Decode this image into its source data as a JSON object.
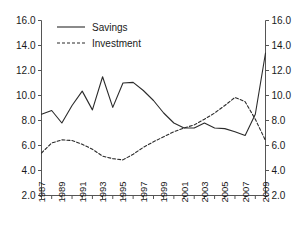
{
  "chart_data": {
    "type": "line",
    "title": "",
    "xlabel": "",
    "ylabel": "",
    "x": [
      1987,
      1988,
      1989,
      1990,
      1991,
      1992,
      1993,
      1994,
      1995,
      1996,
      1997,
      1998,
      1999,
      2000,
      2001,
      2002,
      2003,
      2004,
      2005,
      2006,
      2007,
      2008,
      2009
    ],
    "series": [
      {
        "name": "Savings",
        "style": "solid",
        "values": [
          8.5,
          8.8,
          7.8,
          9.2,
          10.35,
          8.85,
          11.5,
          9.05,
          11.0,
          11.05,
          10.4,
          9.6,
          8.6,
          7.8,
          7.4,
          7.4,
          7.8,
          7.4,
          7.35,
          7.1,
          6.8,
          8.5,
          13.4
        ]
      },
      {
        "name": "Investment",
        "style": "dashed",
        "values": [
          5.4,
          6.2,
          6.45,
          6.4,
          6.1,
          5.7,
          5.15,
          4.95,
          4.85,
          5.3,
          5.85,
          6.3,
          6.7,
          7.1,
          7.4,
          7.65,
          8.1,
          8.6,
          9.2,
          9.85,
          9.5,
          8.1,
          6.4
        ]
      }
    ],
    "xlim": [
      1987,
      2009
    ],
    "ylim": [
      2.0,
      16.0
    ],
    "y_ticks": [
      2.0,
      4.0,
      6.0,
      8.0,
      10.0,
      12.0,
      14.0,
      16.0
    ],
    "y_tick_labels": [
      "2.0",
      "4.0",
      "6.0",
      "8.0",
      "10.0",
      "12.0",
      "14.0",
      "16.0"
    ],
    "y_axis_left_labels": [
      "16.0",
      "14.0",
      "12.0",
      "10.0",
      "8.0",
      "6.0",
      "4.0",
      "2.0"
    ],
    "y_axis_right_labels": [
      "16.0",
      "14.0",
      "12.0",
      "10.0",
      "8.0",
      "6.0",
      "4.0",
      "2.0"
    ],
    "x_ticks": [
      1987,
      1988,
      1989,
      1990,
      1991,
      1992,
      1993,
      1994,
      1995,
      1996,
      1997,
      1998,
      1999,
      2000,
      2001,
      2002,
      2003,
      2004,
      2005,
      2006,
      2007,
      2008,
      2009
    ],
    "x_tick_labels": [
      "1987",
      "1989",
      "1991",
      "1993",
      "1995",
      "1997",
      "1999",
      "2001",
      "2003",
      "2005",
      "2007",
      "2009"
    ],
    "x_labeled_years": [
      1987,
      1989,
      1991,
      1993,
      1995,
      1997,
      1999,
      2001,
      2003,
      2005,
      2007,
      2009
    ],
    "grid": false,
    "legend_position": "top-left",
    "legend": [
      "Savings",
      "Investment"
    ],
    "dual_y_axis": true
  },
  "legend": {
    "items": [
      {
        "label": "Savings",
        "style": "solid"
      },
      {
        "label": "Investment",
        "style": "dashed"
      }
    ]
  },
  "colors": {
    "line": "#2b2b2b",
    "axis": "#555555",
    "text": "#1a1a1a",
    "background": "#ffffff"
  }
}
